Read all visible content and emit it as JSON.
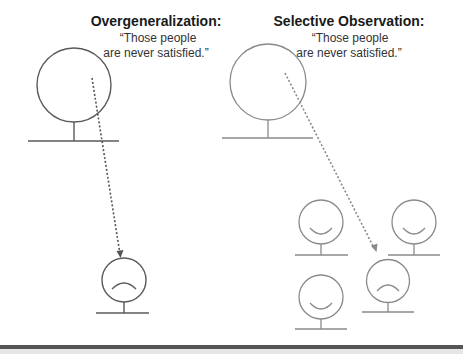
{
  "left_panel": {
    "title": "Overgeneralization:",
    "quote_line1": "“Those people",
    "quote_line2": "are never satisfied.”",
    "stroke_color": "#5a5a5a",
    "figures": [
      {
        "role": "observer",
        "expression": "none"
      },
      {
        "role": "observed-person",
        "expression": "frown"
      }
    ]
  },
  "right_panel": {
    "title": "Selective Observation:",
    "quote_line1": "“Those people",
    "quote_line2": "are never satisfied.”",
    "stroke_color": "#8a8a8a",
    "figures": [
      {
        "role": "observer",
        "expression": "none"
      },
      {
        "role": "person",
        "expression": "smile"
      },
      {
        "role": "person",
        "expression": "smile"
      },
      {
        "role": "person",
        "expression": "smile"
      },
      {
        "role": "observed-person",
        "expression": "frown"
      }
    ]
  },
  "footer_bar_color": "#555555"
}
